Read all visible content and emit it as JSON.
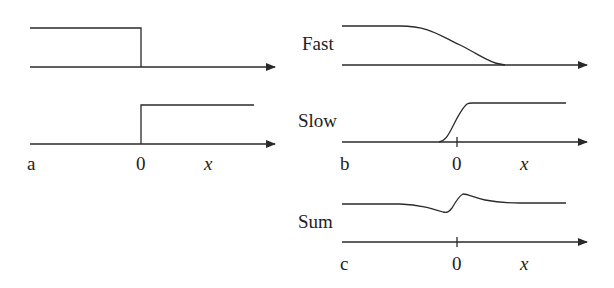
{
  "panels": {
    "a": {
      "label": "a",
      "origin_label": "0",
      "axis_label": "x"
    },
    "b": {
      "label": "b",
      "origin_label": "0",
      "axis_label": "x",
      "curve_labels": {
        "fast": "Fast",
        "slow": "Slow"
      }
    },
    "c": {
      "label": "c",
      "origin_label": "0",
      "axis_label": "x",
      "curve_label": "Sum"
    }
  },
  "colors": {
    "line": "#2a2a2a",
    "text": "#222222"
  }
}
